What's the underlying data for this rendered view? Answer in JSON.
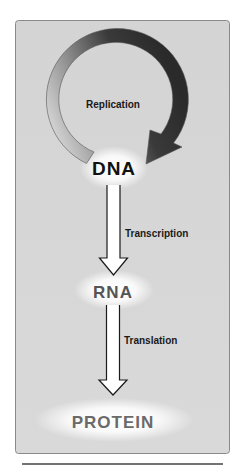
{
  "diagram": {
    "nodes": [
      {
        "id": "dna",
        "label": "DNA",
        "color": "#111111"
      },
      {
        "id": "rna",
        "label": "RNA",
        "color": "#555555"
      },
      {
        "id": "protein",
        "label": "PROTEIN",
        "color": "#6a6a6a"
      }
    ],
    "edges": [
      {
        "from": "dna",
        "to": "dna",
        "label": "Replication",
        "style": "circular-gradient-arrow"
      },
      {
        "from": "dna",
        "to": "rna",
        "label": "Transcription",
        "style": "hollow-arrow"
      },
      {
        "from": "rna",
        "to": "protein",
        "label": "Translation",
        "style": "hollow-arrow"
      }
    ],
    "colors": {
      "panel_background": "#d6d6d6",
      "panel_border": "#8a8a8a",
      "ring_light": "#eeeeee",
      "ring_dark": "#2a2a2a",
      "glow": "#ffffff"
    }
  }
}
